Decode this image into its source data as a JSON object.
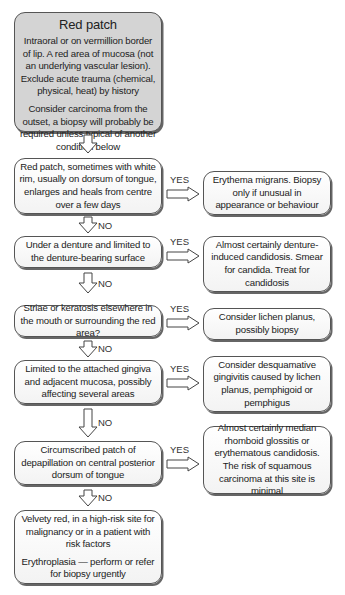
{
  "flowchart": {
    "start": {
      "title": "Red patch",
      "lines_p1": "Intraoral or on vermillion border of lip. A red area of mucosa (not an underlying vascular lesion). Exclude acute trauma (chemical, physical, heat) by history",
      "lines_p2": "Consider carcinoma from the outset, a biopsy will probably be required unless typical of another condition below"
    },
    "decisions": [
      {
        "question": "Red patch, sometimes with white rim, usually on dorsum of tongue, enlarges and heals from centre over a few days",
        "yes_label": "YES",
        "yes_outcome": "Erythema migrans. Biopsy only if unusual in appearance or behaviour",
        "no_label": "NO"
      },
      {
        "question": "Under a denture and limited to the denture-bearing surface",
        "yes_label": "YES",
        "yes_outcome": "Almost certainly denture-induced candidosis. Smear for candida. Treat for candidosis",
        "no_label": "NO"
      },
      {
        "question": "Striae or keratosis elsewhere in the mouth or surrounding the red area?",
        "yes_label": "YES",
        "yes_outcome": "Consider lichen planus, possibly biopsy",
        "no_label": "NO"
      },
      {
        "question": "Limited to the attached gingiva and adjacent mucosa, possibly affecting several areas",
        "yes_label": "YES",
        "yes_outcome": "Consider desquamative gingivitis caused by lichen planus, pemphigoid or pemphigus",
        "no_label": "NO"
      },
      {
        "question": "Circumscribed patch of depapillation on central posterior dorsum of tongue",
        "yes_label": "YES",
        "yes_outcome": "Almost certainly median rhomboid glossitis or erythematous candidosis. The risk of squamous carcinoma at this site is minimal",
        "no_label": "NO"
      }
    ],
    "final": {
      "text_p1": "Velvety red, in a high-risk site for malignancy or in a patient with risk factors",
      "text_p2": "Erythroplasia — perform or refer for biopsy urgently"
    }
  }
}
